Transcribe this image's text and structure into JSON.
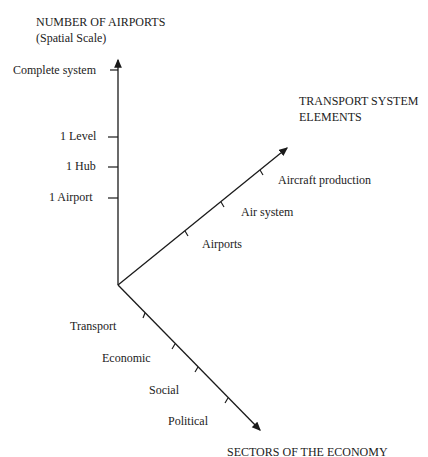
{
  "diagram": {
    "type": "three-axis conceptual diagram",
    "vertical_axis": {
      "title_line1": "NUMBER OF AIRPORTS",
      "title_line2": "(Spatial Scale)",
      "ticks": [
        "1 Airport",
        "1 Hub",
        "1 Level",
        "Complete system"
      ]
    },
    "right_axis": {
      "title_line1": "TRANSPORT SYSTEM",
      "title_line2": "ELEMENTS",
      "ticks": [
        "Airports",
        "Air system",
        "Aircraft production"
      ]
    },
    "lower_axis": {
      "title": "SECTORS OF THE ECONOMY",
      "ticks": [
        "Transport",
        "Economic",
        "Social",
        "Political"
      ]
    },
    "colors": {
      "line": "#1a1a1a",
      "text": "#222222",
      "background": "#ffffff"
    }
  }
}
